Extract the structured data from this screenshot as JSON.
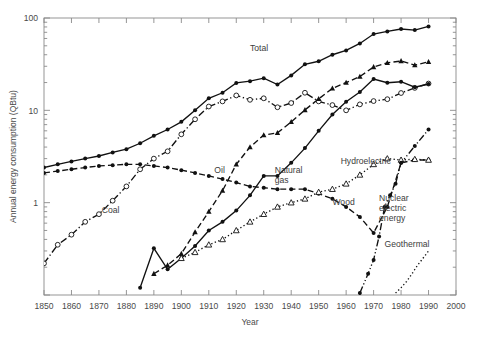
{
  "chart_data": {
    "type": "line",
    "title": "",
    "xlabel": "Year",
    "ylabel": "Annual energy consumption (QBtu)",
    "yscale": "log",
    "xlim": [
      1850,
      2000
    ],
    "ylim": [
      0.1,
      100
    ],
    "xticks": [
      1850,
      1860,
      1870,
      1880,
      1890,
      1900,
      1910,
      1920,
      1930,
      1940,
      1950,
      1960,
      1970,
      1980,
      1990,
      2000
    ],
    "yticks": [
      1,
      10,
      100
    ],
    "ytick_labels": [
      "1",
      "10",
      "100"
    ],
    "grid": false,
    "legend_position": "inline-annotations",
    "series": [
      {
        "name": "Total",
        "label": "Total",
        "label_x": 1925,
        "label_y": 44,
        "marker": "filled-circle",
        "line": "solid",
        "x": [
          1850,
          1855,
          1860,
          1865,
          1870,
          1875,
          1880,
          1885,
          1890,
          1895,
          1900,
          1905,
          1910,
          1915,
          1920,
          1925,
          1930,
          1935,
          1940,
          1945,
          1950,
          1955,
          1960,
          1965,
          1970,
          1975,
          1980,
          1985,
          1990
        ],
        "y": [
          2.4,
          2.6,
          2.8,
          3.0,
          3.2,
          3.5,
          3.8,
          4.4,
          5.3,
          6.2,
          7.5,
          10.0,
          13.5,
          15.5,
          19.8,
          20.7,
          22.3,
          19.0,
          23.9,
          31.5,
          34.0,
          40.0,
          44.5,
          53.0,
          67.0,
          71.5,
          76.0,
          74.0,
          81.0
        ]
      },
      {
        "name": "Coal",
        "label": "Coal",
        "label_x": 1871,
        "label_y": 0.78,
        "marker": "open-circle",
        "line": "dash-dot",
        "x": [
          1850,
          1855,
          1860,
          1865,
          1870,
          1875,
          1880,
          1885,
          1890,
          1895,
          1900,
          1905,
          1910,
          1915,
          1920,
          1925,
          1930,
          1935,
          1940,
          1945,
          1950,
          1955,
          1960,
          1965,
          1970,
          1975,
          1980,
          1985,
          1990
        ],
        "y": [
          0.22,
          0.35,
          0.45,
          0.62,
          0.75,
          1.05,
          1.5,
          2.3,
          3.0,
          3.6,
          5.5,
          8.0,
          11.0,
          12.5,
          14.5,
          13.0,
          13.5,
          10.8,
          12.0,
          15.5,
          12.5,
          11.4,
          10.0,
          11.6,
          12.6,
          13.2,
          15.4,
          17.5,
          19.5
        ]
      },
      {
        "name": "Oil",
        "label": "Oil",
        "label_x": 1912,
        "label_y": 2.1,
        "marker": "filled-triangle",
        "line": "dashed",
        "x": [
          1890,
          1895,
          1900,
          1905,
          1910,
          1915,
          1920,
          1925,
          1930,
          1935,
          1940,
          1945,
          1950,
          1955,
          1960,
          1965,
          1970,
          1975,
          1980,
          1985,
          1990
        ],
        "y": [
          0.17,
          0.21,
          0.28,
          0.48,
          0.8,
          1.35,
          2.6,
          4.0,
          5.4,
          5.7,
          7.5,
          10.1,
          13.3,
          17.3,
          20.0,
          23.2,
          29.5,
          32.7,
          34.2,
          30.9,
          33.5
        ]
      },
      {
        "name": "Natural gas",
        "label": "Natural gas",
        "label_line1": "Natural",
        "label_line2": "gas",
        "label_x": 1934,
        "label_y": 2.1,
        "marker": "filled-circle",
        "line": "solid",
        "x": [
          1885,
          1890,
          1895,
          1900,
          1905,
          1910,
          1915,
          1920,
          1925,
          1930,
          1935,
          1940,
          1945,
          1950,
          1955,
          1960,
          1965,
          1970,
          1975,
          1980,
          1985,
          1990
        ],
        "y": [
          0.12,
          0.32,
          0.19,
          0.25,
          0.34,
          0.5,
          0.62,
          0.82,
          1.2,
          1.95,
          1.95,
          2.7,
          3.9,
          6.0,
          9.0,
          12.4,
          15.8,
          21.8,
          19.9,
          20.4,
          17.8,
          19.3
        ]
      },
      {
        "name": "Wood",
        "label": "Wood",
        "label_x": 1955,
        "label_y": 0.95,
        "marker": "filled-circle",
        "line": "dashed",
        "x": [
          1850,
          1855,
          1860,
          1865,
          1870,
          1875,
          1880,
          1885,
          1890,
          1895,
          1900,
          1905,
          1910,
          1915,
          1920,
          1925,
          1930,
          1935,
          1940,
          1945,
          1950,
          1955,
          1960,
          1965,
          1970,
          1975,
          1980,
          1985,
          1990
        ],
        "y": [
          2.1,
          2.2,
          2.3,
          2.4,
          2.5,
          2.55,
          2.6,
          2.6,
          2.5,
          2.4,
          2.25,
          2.1,
          1.95,
          1.8,
          1.65,
          1.5,
          1.45,
          1.4,
          1.4,
          1.4,
          1.25,
          1.1,
          0.9,
          0.7,
          0.47,
          0.9,
          2.7,
          2.9,
          2.9
        ]
      },
      {
        "name": "Hydroelectric",
        "label": "Hydroelectric",
        "label_x": 1958,
        "label_y": 2.6,
        "marker": "open-triangle",
        "line": "dotted",
        "x": [
          1900,
          1905,
          1910,
          1915,
          1920,
          1925,
          1930,
          1935,
          1940,
          1945,
          1950,
          1955,
          1960,
          1965,
          1970,
          1975,
          1980,
          1985,
          1990
        ],
        "y": [
          0.25,
          0.29,
          0.35,
          0.4,
          0.5,
          0.62,
          0.75,
          0.9,
          1.0,
          1.1,
          1.3,
          1.4,
          1.6,
          2.0,
          2.6,
          3.0,
          2.9,
          2.95,
          2.9
        ]
      },
      {
        "name": "Nuclear electric energy",
        "label": "Nuclear electric energy",
        "label_line1": "Nuclear",
        "label_line2": "electric",
        "label_line3": "energy",
        "label_x": 1972,
        "label_y": 1.05,
        "marker": "filled-circle",
        "line": "dash-dot-dot",
        "x": [
          1965,
          1968,
          1970,
          1972,
          1974,
          1976,
          1978,
          1980,
          1985,
          1990
        ],
        "y": [
          0.105,
          0.17,
          0.24,
          0.43,
          0.9,
          1.2,
          1.6,
          2.7,
          4.1,
          6.2
        ]
      },
      {
        "name": "Geothermal",
        "label": "Geothermal",
        "label_x": 1974,
        "label_y": 0.33,
        "marker": "none",
        "line": "dotted",
        "x": [
          1978,
          1980,
          1982,
          1984,
          1986,
          1988,
          1990
        ],
        "y": [
          0.105,
          0.12,
          0.14,
          0.17,
          0.21,
          0.25,
          0.3
        ]
      }
    ]
  },
  "figure": {
    "caption": ""
  }
}
